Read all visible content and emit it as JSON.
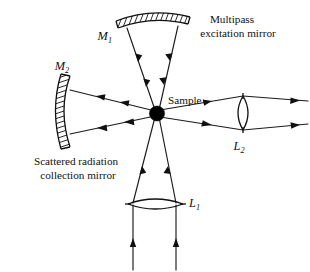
{
  "figure": {
    "background_color": "#ffffff",
    "ink_color": "#101010"
  },
  "labels": {
    "mirror_top": "M",
    "mirror_top_sub": "1",
    "mirror_left": "M",
    "mirror_left_sub": "2",
    "lens_bottom": "L",
    "lens_bottom_sub": "1",
    "lens_right": "L",
    "lens_right_sub": "2",
    "sample": "Sample",
    "multipass_line1": "Multipass",
    "multipass_line2": "excitation mirror",
    "scattered_line1": "Scattered radiation",
    "scattered_line2": "collection mirror"
  },
  "components": [
    {
      "id": "M1",
      "name": "multipass-excitation-mirror",
      "type": "concave-mirror",
      "label": "M1",
      "caption": "Multipass excitation mirror",
      "position": "top",
      "hatched_side": "top"
    },
    {
      "id": "M2",
      "name": "scattered-radiation-collection-mirror",
      "type": "concave-mirror",
      "label": "M2",
      "caption": "Scattered radiation collection mirror",
      "position": "left",
      "hatched_side": "left"
    },
    {
      "id": "L1",
      "name": "focusing-lens-bottom",
      "type": "biconvex-lens",
      "label": "L1",
      "position": "bottom"
    },
    {
      "id": "L2",
      "name": "collection-lens-right",
      "type": "biconvex-lens",
      "label": "L2",
      "position": "right"
    },
    {
      "id": "S",
      "name": "sample-point",
      "type": "sample",
      "label": "Sample",
      "position": "center"
    }
  ],
  "ray_paths": [
    {
      "name": "incoming-beam-left",
      "direction": "upward",
      "from": "below",
      "to": "L1"
    },
    {
      "name": "incoming-beam-right",
      "direction": "upward",
      "from": "below",
      "to": "L1"
    },
    {
      "name": "converging-ray-left",
      "direction": "upward",
      "from": "L1",
      "to": "Sample"
    },
    {
      "name": "converging-ray-right",
      "direction": "upward",
      "from": "L1",
      "to": "Sample"
    },
    {
      "name": "multipass-ray-left",
      "direction": "downward",
      "from": "M1",
      "to": "Sample"
    },
    {
      "name": "multipass-ray-right",
      "direction": "downward",
      "from": "M1",
      "to": "Sample"
    },
    {
      "name": "scattered-ray-upper-left",
      "direction": "leftward",
      "from": "Sample",
      "to": "M2"
    },
    {
      "name": "scattered-ray-lower-left",
      "direction": "leftward",
      "from": "Sample",
      "to": "M2"
    },
    {
      "name": "collected-ray-upper-right",
      "direction": "rightward",
      "from": "Sample",
      "to": "L2"
    },
    {
      "name": "collected-ray-lower-right",
      "direction": "rightward",
      "from": "Sample",
      "to": "L2"
    },
    {
      "name": "output-ray-upper",
      "direction": "rightward",
      "from": "L2",
      "to": "detector"
    },
    {
      "name": "output-ray-lower",
      "direction": "rightward",
      "from": "L2",
      "to": "detector"
    }
  ]
}
